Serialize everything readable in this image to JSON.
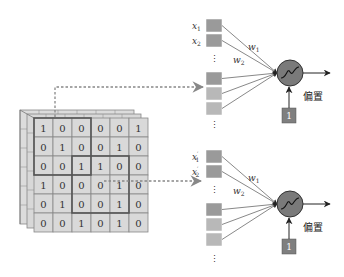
{
  "diagram": {
    "type": "convolution-to-neurons",
    "input_grid": {
      "rows": [
        [
          1,
          0,
          0,
          0,
          0,
          1
        ],
        [
          0,
          1,
          0,
          0,
          1,
          0
        ],
        [
          0,
          0,
          1,
          1,
          0,
          0
        ],
        [
          1,
          0,
          0,
          0,
          1,
          0
        ],
        [
          0,
          1,
          0,
          0,
          1,
          0
        ],
        [
          0,
          0,
          1,
          0,
          1,
          0
        ]
      ],
      "highlight_windows": [
        {
          "row": 0,
          "col": 0,
          "size": 3
        },
        {
          "row": 2,
          "col": 2,
          "size": 3
        }
      ]
    },
    "neurons": [
      {
        "inputs": [
          {
            "var": "x",
            "sub": "1",
            "prime": false
          },
          {
            "var": "x",
            "sub": "2",
            "prime": false
          }
        ],
        "weights": [
          {
            "var": "w",
            "sub": "1"
          },
          {
            "var": "w",
            "sub": "2"
          }
        ],
        "bias_label": "偏置",
        "bias_value": "1",
        "ellipsis": "⋮"
      },
      {
        "inputs": [
          {
            "var": "x",
            "sub": "1",
            "prime": true
          },
          {
            "var": "x",
            "sub": "2",
            "prime": true
          }
        ],
        "weights": [
          {
            "var": "w",
            "sub": "1"
          },
          {
            "var": "w",
            "sub": "2"
          }
        ],
        "bias_label": "偏置",
        "bias_value": "1",
        "ellipsis": "⋮"
      }
    ],
    "colors": {
      "grid_cell": "#d9d9d9",
      "grid_border": "#888888",
      "highlight_border": "#555555",
      "input_box_dark": "#9a9a9a",
      "input_box_light": "#b8b8b8",
      "neuron_fill": "#7a7a7a",
      "bias_box": "#7f7f7f",
      "arrow": "#222222"
    }
  }
}
